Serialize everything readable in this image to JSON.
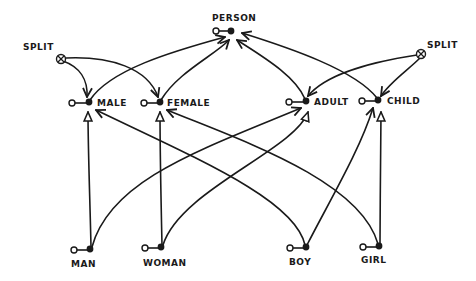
{
  "diagram": {
    "type": "hand-drawn concept hierarchy / semantic network",
    "nodes": [
      {
        "id": "person",
        "label": "PERSON",
        "x": 231,
        "y": 31,
        "lx": 216,
        "ly": 19
      },
      {
        "id": "split_left",
        "label": "SPLIT",
        "x": 61,
        "y": 59,
        "lx": 24,
        "ly": 48,
        "kind": "split"
      },
      {
        "id": "split_right",
        "label": "SPLIT",
        "x": 421,
        "y": 54,
        "lx": 428,
        "ly": 46,
        "kind": "split"
      },
      {
        "id": "male",
        "label": "MALE",
        "x": 89,
        "y": 102,
        "lx": 97,
        "ly": 106
      },
      {
        "id": "female",
        "label": "FEMALE",
        "x": 160,
        "y": 102,
        "lx": 167,
        "ly": 106
      },
      {
        "id": "adult",
        "label": "ADULT",
        "x": 306,
        "y": 101,
        "lx": 313,
        "ly": 105
      },
      {
        "id": "child",
        "label": "CHILD",
        "x": 378,
        "y": 100,
        "lx": 386,
        "ly": 104
      },
      {
        "id": "man",
        "label": "MAN",
        "x": 90,
        "y": 249,
        "lx": 72,
        "ly": 266
      },
      {
        "id": "woman",
        "label": "WOMAN",
        "x": 161,
        "y": 247,
        "lx": 145,
        "ly": 265
      },
      {
        "id": "boy",
        "label": "BOY",
        "x": 306,
        "y": 247,
        "lx": 296,
        "ly": 264
      },
      {
        "id": "girl",
        "label": "GIRL",
        "x": 379,
        "y": 246,
        "lx": 364,
        "ly": 262
      }
    ],
    "edges": [
      {
        "from": "male",
        "to": "person",
        "arrow": "open"
      },
      {
        "from": "female",
        "to": "person",
        "arrow": "open"
      },
      {
        "from": "adult",
        "to": "person",
        "arrow": "open"
      },
      {
        "from": "child",
        "to": "person",
        "arrow": "open"
      },
      {
        "from": "split_left",
        "to": "male",
        "arrow": "line"
      },
      {
        "from": "split_left",
        "to": "female",
        "arrow": "line"
      },
      {
        "from": "split_right",
        "to": "adult",
        "arrow": "line"
      },
      {
        "from": "split_right",
        "to": "child",
        "arrow": "line"
      },
      {
        "from": "man",
        "to": "male",
        "arrow": "triangle"
      },
      {
        "from": "man",
        "to": "adult",
        "arrow": "line"
      },
      {
        "from": "woman",
        "to": "female",
        "arrow": "triangle"
      },
      {
        "from": "woman",
        "to": "adult",
        "arrow": "triangle"
      },
      {
        "from": "boy",
        "to": "male",
        "arrow": "line"
      },
      {
        "from": "boy",
        "to": "child",
        "arrow": "line"
      },
      {
        "from": "girl",
        "to": "female",
        "arrow": "line"
      },
      {
        "from": "girl",
        "to": "child",
        "arrow": "triangle"
      }
    ],
    "colors": {
      "ink": "#1a1a1a",
      "background": "#ffffff"
    }
  }
}
